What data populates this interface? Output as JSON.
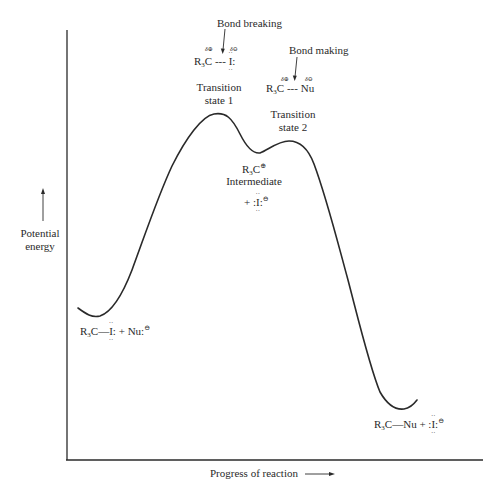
{
  "diagram": {
    "type": "reaction-energy-profile",
    "y_axis": {
      "label_line1": "Potential",
      "label_line2": "energy",
      "arrow": "up-arrow"
    },
    "x_axis": {
      "label": "Progress of reaction",
      "arrow": "right-arrow"
    },
    "annotations": {
      "bond_breaking": {
        "label": "Bond breaking",
        "species": "R3C --- I:",
        "partial_charges": [
          "δ⊕",
          "δ⊖"
        ]
      },
      "bond_making": {
        "label": "Bond making",
        "species": "R3C --- Nu",
        "partial_charges": [
          "δ⊕",
          "δ⊖"
        ]
      },
      "transition_state_1": {
        "line1": "Transition",
        "line2": "state 1"
      },
      "transition_state_2": {
        "line1": "Transition",
        "line2": "state 2"
      },
      "intermediate": {
        "cation": "R3C⊕",
        "label": "Intermediate",
        "plus_iodide": "+ :I:⊖"
      },
      "reactants": "R3C—I: + Nu:⊖",
      "products": "R3C—Nu + :I:⊖"
    },
    "text": {
      "bond_breaking": "Bond breaking",
      "bond_making": "Bond making",
      "ts1_line1": "Transition",
      "ts1_line2": "state 1",
      "ts2_line1": "Transition",
      "ts2_line2": "state 2",
      "intermediate": "Intermediate",
      "R": "R",
      "three": "3",
      "C": "C",
      "I": "I",
      "Nu": "Nu",
      "plus": "+",
      "bond_dash": "---",
      "bond_single": "—",
      "colon": ":",
      "dots": "··",
      "plus_charge": "⊕",
      "minus_charge": "⊖",
      "delta_plus": "δ⊕",
      "delta_minus": "δ⊖",
      "pot": "Potential",
      "energy": "energy",
      "progress": "Progress of reaction"
    },
    "curve_points": [
      {
        "x": 78,
        "y": 308,
        "note": "start"
      },
      {
        "x": 95,
        "y": 316,
        "note": "reactant minimum"
      },
      {
        "x": 219,
        "y": 114,
        "note": "transition state 1 (highest)"
      },
      {
        "x": 258,
        "y": 154,
        "note": "intermediate minimum"
      },
      {
        "x": 289,
        "y": 141,
        "note": "transition state 2"
      },
      {
        "x": 402,
        "y": 408,
        "note": "product minimum"
      },
      {
        "x": 417,
        "y": 400,
        "note": "end"
      }
    ],
    "colors": {
      "line": "#2a2a2a",
      "background": "#ffffff"
    }
  }
}
